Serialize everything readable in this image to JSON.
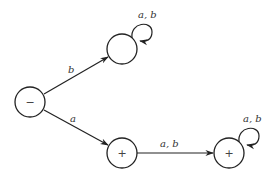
{
  "diagram": {
    "type": "finite-automaton",
    "nodes": [
      {
        "id": "start",
        "marker": "−",
        "role": "start state"
      },
      {
        "id": "top",
        "marker": "",
        "role": "trap state"
      },
      {
        "id": "mid",
        "marker": "+",
        "role": "final state"
      },
      {
        "id": "right",
        "marker": "+",
        "role": "final state"
      }
    ],
    "edges": [
      {
        "from": "start",
        "to": "top",
        "label": "b"
      },
      {
        "from": "start",
        "to": "mid",
        "label": "a"
      },
      {
        "from": "mid",
        "to": "right",
        "label": "a, b"
      },
      {
        "from": "top",
        "to": "top",
        "label": "a, b"
      },
      {
        "from": "right",
        "to": "right",
        "label": "a, b"
      }
    ]
  }
}
